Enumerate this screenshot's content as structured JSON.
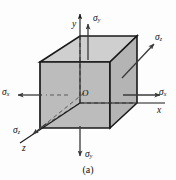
{
  "figure": {
    "caption": "(a)",
    "origin_label": "O",
    "axes": [
      {
        "name": "y-axis",
        "label": "y"
      },
      {
        "name": "x-axis",
        "label": "x"
      },
      {
        "name": "z-axis",
        "label": "z"
      }
    ],
    "stress_labels": [
      {
        "name": "sigma-y-top",
        "symbol": "σ",
        "subscript": "y"
      },
      {
        "name": "sigma-y-bottom",
        "symbol": "σ",
        "subscript": "y"
      },
      {
        "name": "sigma-x-left",
        "symbol": "σ",
        "subscript": "x"
      },
      {
        "name": "sigma-x-right",
        "symbol": "σ",
        "subscript": "x"
      },
      {
        "name": "sigma-z-upper",
        "symbol": "σ",
        "subscript": "z"
      },
      {
        "name": "sigma-z-lower",
        "symbol": "σ",
        "subscript": "z"
      }
    ],
    "colors": {
      "face_fill": "#b8b8b8",
      "top_face_fill": "#d0d0d0",
      "outline": "#1a1a1a",
      "arrow": "#3a3a3a",
      "dashed": "#555555",
      "background": "#fdfdfd",
      "text": "#111111"
    }
  }
}
